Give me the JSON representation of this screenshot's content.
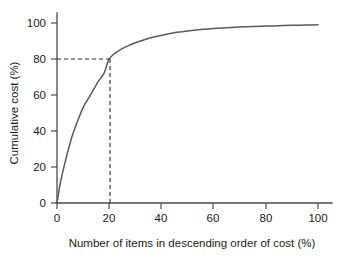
{
  "chart_data": {
    "type": "line",
    "title": "",
    "subtitle": "",
    "xlabel": "Number of items in descending order of cost (%)",
    "ylabel": "Cumulative cost (%)",
    "xlim": [
      0,
      108
    ],
    "ylim": [
      0,
      105
    ],
    "grid": false,
    "legend": null,
    "legend_position": "none",
    "xticks": [
      0,
      20,
      40,
      60,
      80,
      100
    ],
    "xtick_labels": [
      "0",
      "20",
      "40",
      "60",
      "80",
      "100"
    ],
    "yticks": [
      0,
      20,
      40,
      60,
      80,
      100
    ],
    "ytick_labels": [
      "0",
      "20",
      "40",
      "60",
      "80",
      "100"
    ],
    "series": [
      {
        "name": "Cumulative cost curve",
        "color": "#5a5a5a",
        "x": [
          0,
          1,
          2,
          3,
          4,
          5,
          6,
          8,
          10,
          12,
          14,
          16,
          18,
          20,
          23,
          26,
          30,
          34,
          38,
          42,
          46,
          50,
          55,
          60,
          65,
          70,
          75,
          80,
          85,
          90,
          95,
          100
        ],
        "y": [
          0,
          9,
          16,
          22,
          28,
          33,
          38,
          46,
          53,
          58,
          63,
          68,
          72,
          80,
          84,
          86.5,
          89,
          91,
          92.5,
          93.8,
          94.8,
          95.6,
          96.4,
          97.0,
          97.4,
          97.8,
          98.1,
          98.3,
          98.5,
          98.7,
          98.85,
          99
        ]
      }
    ],
    "annotations": [
      {
        "name": "pareto-80-20-guide",
        "style": "dashed",
        "x": 20,
        "y": 80,
        "label_x": "20",
        "label_y": "80",
        "description": "Dashed guide lines from y-axis at 80% across to the curve and down to x-axis at 20%"
      }
    ]
  },
  "axes": {
    "x_title": "Number of items in descending order of cost (%)",
    "y_title": "Cumulative cost (%)"
  },
  "colors": {
    "background": "#ffffff",
    "curve": "#5a5a5a",
    "axis": "#4a4a4a",
    "text": "#1a1a1a",
    "guide": "#2a2a2a"
  }
}
